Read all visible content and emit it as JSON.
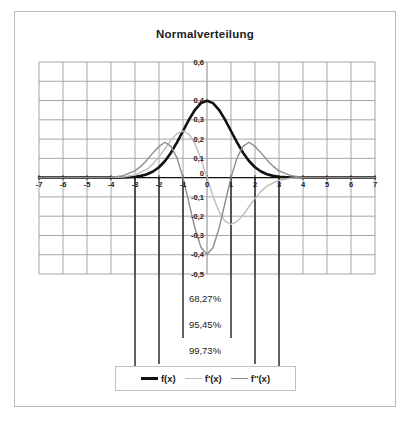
{
  "chart_title": "Normalverteilung",
  "legend": {
    "items": [
      {
        "label": "f(x)",
        "style": "thick",
        "color": "#111111"
      },
      {
        "label": "f'(x)",
        "style": "thin-light",
        "color": "#bdbdbd"
      },
      {
        "label": "f''(x)",
        "style": "thin-mid",
        "color": "#8d8d8d"
      }
    ]
  },
  "sigma_annotations": [
    {
      "label": "68,27%",
      "sigma": 1
    },
    {
      "label": "95,45%",
      "sigma": 2
    },
    {
      "label": "99,73%",
      "sigma": 3
    }
  ],
  "chart_data": {
    "type": "line",
    "title": "Normalverteilung",
    "xlabel": "",
    "ylabel": "",
    "xlim": [
      -7,
      7
    ],
    "ylim": [
      -0.5,
      0.6
    ],
    "grid": true,
    "legend_position": "bottom",
    "xticks": [
      -7,
      -6,
      -5,
      -4,
      -3,
      -2,
      -1,
      0,
      1,
      2,
      3,
      4,
      5,
      6,
      7
    ],
    "xticklabels": [
      "-7",
      "-6",
      "-5",
      "-4",
      "-3",
      "-2",
      "-1",
      "0",
      "1",
      "2",
      "3",
      "4",
      "5",
      "6",
      "7"
    ],
    "yticks": [
      -0.5,
      -0.4,
      -0.3,
      -0.2,
      -0.1,
      0,
      0.1,
      0.2,
      0.3,
      0.4,
      0.6
    ],
    "yticklabels": [
      "-0,5",
      "-0,4",
      "-0,3",
      "-0,2",
      "-0,1",
      "0",
      "0,1",
      "0,2",
      "0,3",
      "0,4",
      "0,6"
    ],
    "series": [
      {
        "name": "f(x)",
        "color": "#111111",
        "width": 2.6,
        "formula": "gaussian pdf, mu=0, sigma=1",
        "x": [
          -7,
          -6.5,
          -6,
          -5.5,
          -5,
          -4.5,
          -4,
          -3.5,
          -3,
          -2.75,
          -2.5,
          -2.25,
          -2,
          -1.75,
          -1.5,
          -1.25,
          -1,
          -0.75,
          -0.5,
          -0.25,
          0,
          0.25,
          0.5,
          0.75,
          1,
          1.25,
          1.5,
          1.75,
          2,
          2.25,
          2.5,
          2.75,
          3,
          3.5,
          4,
          4.5,
          5,
          5.5,
          6,
          6.5,
          7
        ],
        "y": [
          0,
          0,
          0,
          0,
          0,
          0,
          0.0001,
          0.0009,
          0.0044,
          0.0091,
          0.0175,
          0.0317,
          0.054,
          0.0863,
          0.1295,
          0.1826,
          0.242,
          0.3011,
          0.3521,
          0.3867,
          0.3989,
          0.3867,
          0.3521,
          0.3011,
          0.242,
          0.1826,
          0.1295,
          0.0863,
          0.054,
          0.0317,
          0.0175,
          0.0091,
          0.0044,
          0.0009,
          0.0001,
          0,
          0,
          0,
          0,
          0,
          0
        ]
      },
      {
        "name": "f'(x)",
        "color": "#bdbdbd",
        "width": 1.4,
        "formula": "-x * gaussian pdf",
        "x": [
          -7,
          -6,
          -5,
          -4.5,
          -4,
          -3.5,
          -3,
          -2.5,
          -2.25,
          -2,
          -1.75,
          -1.5,
          -1.25,
          -1,
          -0.75,
          -0.5,
          -0.25,
          0,
          0.25,
          0.5,
          0.75,
          1,
          1.25,
          1.5,
          1.75,
          2,
          2.25,
          2.5,
          3,
          3.5,
          4,
          4.5,
          5,
          6,
          7
        ],
        "y": [
          0,
          0,
          0,
          0,
          0.0005,
          0.0031,
          0.0133,
          0.0438,
          0.0713,
          0.108,
          0.151,
          0.1943,
          0.2283,
          0.242,
          0.2258,
          0.176,
          0.0967,
          0,
          -0.0967,
          -0.176,
          -0.2258,
          -0.242,
          -0.2283,
          -0.1943,
          -0.151,
          -0.108,
          -0.0713,
          -0.0438,
          -0.0133,
          -0.0031,
          -0.0005,
          0,
          0,
          0,
          0
        ]
      },
      {
        "name": "f''(x)",
        "color": "#8d8d8d",
        "width": 1.4,
        "formula": "(x^2 - 1) * gaussian pdf",
        "x": [
          -7,
          -6,
          -5,
          -4.5,
          -4,
          -3.5,
          -3,
          -2.75,
          -2.5,
          -2.25,
          -2,
          -1.75,
          -1.5,
          -1.25,
          -1,
          -0.75,
          -0.5,
          -0.25,
          0,
          0.25,
          0.5,
          0.75,
          1,
          1.25,
          1.5,
          1.75,
          2,
          2.25,
          2.5,
          2.75,
          3,
          3.5,
          4,
          4.5,
          5,
          6,
          7
        ],
        "y": [
          0,
          0,
          0,
          0.0001,
          0.0015,
          0.0102,
          0.0353,
          0.0596,
          0.092,
          0.1284,
          0.162,
          0.1837,
          0.1619,
          0.1026,
          0,
          -0.1317,
          -0.2641,
          -0.3625,
          -0.3989,
          -0.3625,
          -0.2641,
          -0.1317,
          0,
          0.1026,
          0.1619,
          0.1837,
          0.162,
          0.1284,
          0.092,
          0.0596,
          0.0353,
          0.0102,
          0.0015,
          0.0001,
          0,
          0,
          0
        ]
      }
    ],
    "vertical_markers": [
      {
        "x": -1,
        "sigma": 1
      },
      {
        "x": 1,
        "sigma": 1
      },
      {
        "x": -2,
        "sigma": 2
      },
      {
        "x": 2,
        "sigma": 2
      },
      {
        "x": -3,
        "sigma": 3
      },
      {
        "x": 3,
        "sigma": 3
      }
    ],
    "annotations": [
      "68,27%",
      "95,45%",
      "99,73%"
    ]
  }
}
